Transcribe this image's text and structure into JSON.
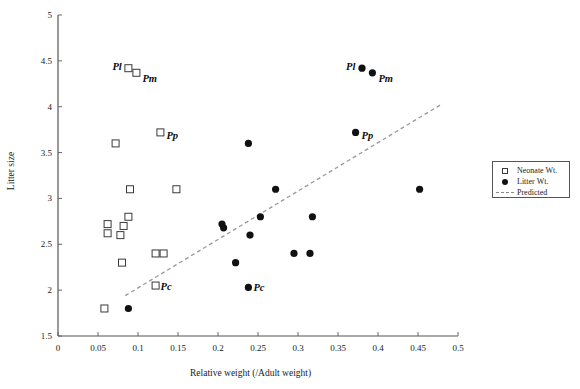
{
  "chart_data": {
    "type": "scatter",
    "title": "",
    "xlabel": "Relative weight (/Adult weight)",
    "ylabel": "Litter size",
    "xlim": [
      0,
      0.5
    ],
    "ylim": [
      1.5,
      5
    ],
    "xticks": [
      "0",
      "0.05",
      "0.1",
      "0.15",
      "0.2",
      "0.25",
      "0.3",
      "0.35",
      "0.4",
      "0.45",
      "0.5"
    ],
    "xtickvals": [
      0,
      0.05,
      0.1,
      0.15,
      0.2,
      0.25,
      0.3,
      0.35,
      0.4,
      0.45,
      0.5
    ],
    "yticks": [
      "1.5",
      "2",
      "2.5",
      "3",
      "3.5",
      "4",
      "4.5",
      "5"
    ],
    "ytickvals": [
      1.5,
      2,
      2.5,
      3,
      3.5,
      4,
      4.5,
      5
    ],
    "grid": false,
    "legend_position": "right",
    "series": [
      {
        "name": "Neonate Wt.",
        "marker": "open-square",
        "color": "#3a3a3a",
        "points": [
          {
            "x": 0.088,
            "y": 4.42,
            "label": "Pl"
          },
          {
            "x": 0.098,
            "y": 4.37,
            "label": "Pm"
          },
          {
            "x": 0.128,
            "y": 3.72,
            "label": "Pp"
          },
          {
            "x": 0.072,
            "y": 3.6,
            "label": ""
          },
          {
            "x": 0.09,
            "y": 3.1,
            "label": ""
          },
          {
            "x": 0.148,
            "y": 3.1,
            "label": ""
          },
          {
            "x": 0.088,
            "y": 2.8,
            "label": ""
          },
          {
            "x": 0.062,
            "y": 2.72,
            "label": ""
          },
          {
            "x": 0.082,
            "y": 2.7,
            "label": ""
          },
          {
            "x": 0.062,
            "y": 2.62,
            "label": ""
          },
          {
            "x": 0.078,
            "y": 2.6,
            "label": ""
          },
          {
            "x": 0.122,
            "y": 2.4,
            "label": ""
          },
          {
            "x": 0.132,
            "y": 2.4,
            "label": ""
          },
          {
            "x": 0.08,
            "y": 2.3,
            "label": ""
          },
          {
            "x": 0.122,
            "y": 2.05,
            "label": "Pc"
          },
          {
            "x": 0.058,
            "y": 1.8,
            "label": ""
          }
        ]
      },
      {
        "name": "Litter Wt.",
        "marker": "filled-circle",
        "color": "#111111",
        "points": [
          {
            "x": 0.38,
            "y": 4.42,
            "label": "Pl"
          },
          {
            "x": 0.393,
            "y": 4.37,
            "label": "Pm"
          },
          {
            "x": 0.372,
            "y": 3.72,
            "label": "Pp"
          },
          {
            "x": 0.238,
            "y": 3.6,
            "label": ""
          },
          {
            "x": 0.272,
            "y": 3.1,
            "label": ""
          },
          {
            "x": 0.452,
            "y": 3.1,
            "label": ""
          },
          {
            "x": 0.318,
            "y": 2.8,
            "label": ""
          },
          {
            "x": 0.253,
            "y": 2.8,
            "label": ""
          },
          {
            "x": 0.205,
            "y": 2.72,
            "label": ""
          },
          {
            "x": 0.207,
            "y": 2.68,
            "label": ""
          },
          {
            "x": 0.24,
            "y": 2.6,
            "label": ""
          },
          {
            "x": 0.295,
            "y": 2.4,
            "label": ""
          },
          {
            "x": 0.315,
            "y": 2.4,
            "label": ""
          },
          {
            "x": 0.222,
            "y": 2.3,
            "label": ""
          },
          {
            "x": 0.238,
            "y": 2.03,
            "label": "Pc"
          },
          {
            "x": 0.088,
            "y": 1.8,
            "label": ""
          }
        ]
      }
    ],
    "trendline": {
      "name": "Predicted",
      "style": "dashed",
      "color": "#9a9a9a",
      "x0": 0.084,
      "y0": 1.94,
      "x1": 0.478,
      "y1": 4.02
    }
  },
  "legend": {
    "items": [
      {
        "key": "open-square-icon",
        "label": "Neonate Wt."
      },
      {
        "key": "filled-dot-icon",
        "label": "Litter Wt."
      },
      {
        "key": "dashed-line-icon",
        "label": "Predicted"
      }
    ]
  }
}
